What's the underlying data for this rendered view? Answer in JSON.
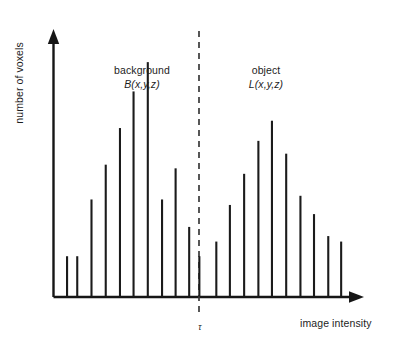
{
  "figure": {
    "background_color": "#ffffff",
    "line_color": "#161616",
    "bar_color": "#1b1b1b",
    "threshold_color": "#3a3a3a"
  },
  "axes": {
    "y_label": "number of voxels",
    "x_label": "image intensity",
    "threshold_label": "τ"
  },
  "annotations": {
    "background_group": {
      "title": "background",
      "formula": "B(x,y,z)"
    },
    "object_group": {
      "title": "object",
      "formula": "L(x,y,z)"
    }
  },
  "chart_data": {
    "type": "bar",
    "title": "",
    "xlabel": "image intensity",
    "ylabel": "number of voxels",
    "grid": false,
    "legend": null,
    "axis_style": "arrow-headed, no tick labels",
    "xlim": [
      0,
      22
    ],
    "ylim": [
      0,
      145
    ],
    "annotations": [
      {
        "text": "background",
        "x": 5.0,
        "y": 132
      },
      {
        "text": "B(x,y,z)",
        "x": 5.0,
        "y": 122,
        "italic": true
      },
      {
        "text": "object",
        "x": 15.3,
        "y": 132
      },
      {
        "text": "L(x,y,z)",
        "x": 15.3,
        "y": 122,
        "italic": true
      },
      {
        "text": "τ",
        "x": 11.0,
        "y": -14,
        "italic": true
      }
    ],
    "threshold": {
      "label": "τ",
      "x": 11.0,
      "style": "dashed vertical line"
    },
    "series": [
      {
        "name": "background B(x,y,z)",
        "x": [
          1,
          1.75,
          2.8,
          3.85,
          4.9,
          5.9,
          6.95,
          8.0,
          9.0,
          10.0,
          10.75
        ],
        "values": [
          22,
          22,
          53,
          72,
          92,
          112,
          128,
          53,
          70,
          38,
          22
        ]
      },
      {
        "name": "object L(x,y,z)",
        "x": [
          12.0,
          13.0,
          14.05,
          15.1,
          16.1,
          17.15,
          18.2,
          19.2,
          20.25,
          21.2
        ],
        "values": [
          30,
          50,
          67,
          85,
          96,
          78,
          55,
          45,
          33,
          30
        ]
      }
    ]
  }
}
